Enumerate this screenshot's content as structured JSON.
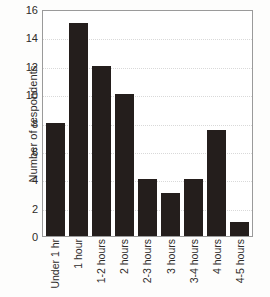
{
  "chart_data": {
    "type": "bar",
    "title": "",
    "xlabel": "",
    "ylabel": "Number of respondents",
    "categories": [
      "Under 1 hr",
      "1 hour",
      "1-2 hours",
      "2 hours",
      "2-3 hours",
      "3 hours",
      "3-4 hours",
      "4 hours",
      "4-5 hours"
    ],
    "values": [
      8,
      15,
      12,
      10,
      4,
      3,
      4,
      7.5,
      1
    ],
    "ylim": [
      0,
      16
    ],
    "yticks": [
      0,
      2,
      4,
      6,
      8,
      10,
      12,
      14,
      16
    ],
    "ytick_labels": [
      "0",
      "2",
      "4",
      "6",
      "8",
      "10",
      "12",
      "14",
      "16"
    ],
    "grid": true,
    "grid_axis": "y",
    "grid_style": "dotted",
    "legend": false,
    "bar_color": "#241e1c",
    "grid_color": "#d9d9d9",
    "axis_color": "#9a9a9a",
    "background_color": "#ffffff",
    "text_color": "#2e2b29"
  }
}
